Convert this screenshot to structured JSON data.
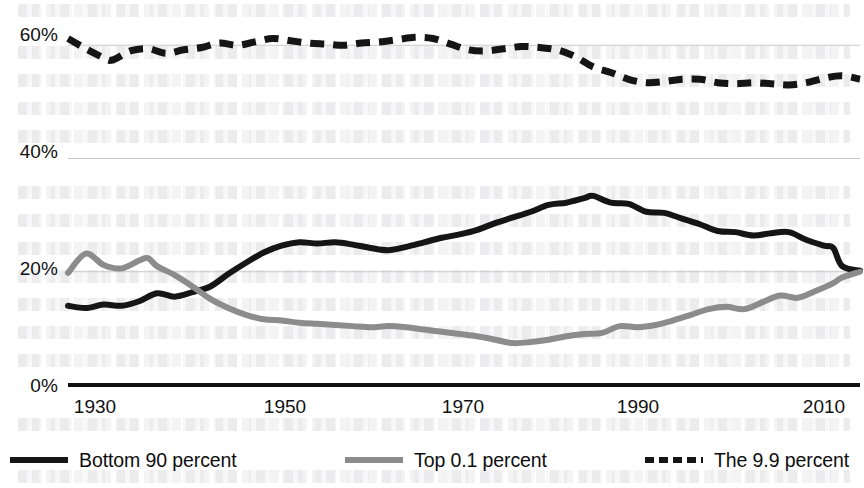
{
  "chart_data": {
    "type": "line",
    "title": "",
    "subtitle": "",
    "xlabel": "",
    "ylabel": "",
    "xlim": [
      1927,
      2016
    ],
    "ylim": [
      0,
      68
    ],
    "grid": true,
    "legend_position": "bottom",
    "y_ticks": [
      "0%",
      "20%",
      "40%",
      "60%"
    ],
    "y_tick_values": [
      0,
      20,
      40,
      60
    ],
    "x_ticks": [
      "1930",
      "1950",
      "1970",
      "1990",
      "2010"
    ],
    "x_tick_values": [
      1930,
      1950,
      1970,
      1990,
      2010
    ],
    "colors": {
      "bottom90": "#151515",
      "top01": "#8c8c8c",
      "the99": "#151515",
      "gridline": "#c9c9c9",
      "axis": "#111111",
      "background": "#ffffff"
    },
    "series": [
      {
        "name": "Bottom 90 percent",
        "style": "solid",
        "color": "#151515",
        "x": [
          1927,
          1929,
          1931,
          1933,
          1935,
          1937,
          1939,
          1941,
          1943,
          1945,
          1947,
          1949,
          1951,
          1953,
          1955,
          1957,
          1959,
          1961,
          1963,
          1965,
          1967,
          1969,
          1971,
          1973,
          1975,
          1977,
          1979,
          1981,
          1983,
          1985,
          1986,
          1988,
          1990,
          1992,
          1994,
          1996,
          1998,
          2000,
          2002,
          2004,
          2006,
          2008,
          2010,
          2012,
          2013,
          2014,
          2016
        ],
        "values": [
          14.0,
          13.6,
          14.2,
          14.0,
          14.8,
          16.2,
          15.6,
          16.4,
          17.4,
          19.6,
          21.6,
          23.4,
          24.6,
          25.2,
          25.0,
          25.2,
          24.8,
          24.2,
          23.8,
          24.4,
          25.2,
          26.0,
          26.6,
          27.4,
          28.6,
          29.6,
          30.6,
          31.8,
          32.2,
          33.0,
          33.4,
          32.2,
          32.0,
          30.6,
          30.4,
          29.4,
          28.4,
          27.2,
          27.0,
          26.4,
          26.8,
          27.0,
          25.6,
          24.6,
          24.2,
          21.0,
          20.2
        ]
      },
      {
        "name": "Top 0.1 percent",
        "style": "solid",
        "color": "#8c8c8c",
        "x": [
          1927,
          1929,
          1931,
          1933,
          1935,
          1936,
          1937,
          1939,
          1941,
          1943,
          1945,
          1947,
          1949,
          1951,
          1953,
          1955,
          1957,
          1959,
          1961,
          1963,
          1965,
          1967,
          1969,
          1971,
          1973,
          1975,
          1977,
          1979,
          1981,
          1983,
          1985,
          1987,
          1989,
          1991,
          1993,
          1995,
          1997,
          1999,
          2001,
          2003,
          2005,
          2007,
          2009,
          2011,
          2013,
          2014,
          2016
        ],
        "values": [
          19.8,
          23.2,
          21.2,
          20.6,
          22.0,
          22.4,
          21.0,
          19.4,
          17.4,
          15.2,
          13.6,
          12.4,
          11.6,
          11.4,
          11.0,
          10.8,
          10.6,
          10.4,
          10.2,
          10.4,
          10.2,
          9.8,
          9.4,
          9.0,
          8.6,
          8.0,
          7.4,
          7.6,
          8.0,
          8.6,
          9.0,
          9.2,
          10.4,
          10.2,
          10.6,
          11.4,
          12.4,
          13.4,
          13.8,
          13.4,
          14.6,
          15.8,
          15.4,
          16.6,
          18.0,
          19.0,
          20.0
        ]
      },
      {
        "name": "The 9.9 percent",
        "style": "dashed",
        "color": "#151515",
        "x": [
          1927,
          1929,
          1931,
          1932,
          1934,
          1936,
          1938,
          1940,
          1942,
          1944,
          1946,
          1948,
          1950,
          1952,
          1954,
          1956,
          1958,
          1960,
          1962,
          1964,
          1966,
          1968,
          1970,
          1972,
          1974,
          1976,
          1978,
          1980,
          1982,
          1984,
          1986,
          1988,
          1990,
          1992,
          1994,
          1996,
          1998,
          2000,
          2002,
          2004,
          2006,
          2008,
          2010,
          2012,
          2014,
          2016
        ],
        "values": [
          61.2,
          59.4,
          57.8,
          57.4,
          59.0,
          59.4,
          58.6,
          59.2,
          59.6,
          60.4,
          60.0,
          60.6,
          61.2,
          60.8,
          60.4,
          60.2,
          60.0,
          60.4,
          60.6,
          61.0,
          61.4,
          61.2,
          60.2,
          59.2,
          59.0,
          59.4,
          59.8,
          59.6,
          59.2,
          58.0,
          56.2,
          55.2,
          54.0,
          53.4,
          53.6,
          54.0,
          54.0,
          53.4,
          53.2,
          53.4,
          53.2,
          53.0,
          53.4,
          54.2,
          54.6,
          54.0
        ]
      }
    ]
  },
  "legend": {
    "items": [
      {
        "label": "Bottom 90 percent",
        "marker": "line-solid-dark-swatch"
      },
      {
        "label": "Top 0.1 percent",
        "marker": "line-solid-gray-swatch"
      },
      {
        "label": "The 9.9 percent",
        "marker": "line-dashed-dark-swatch"
      }
    ]
  },
  "axes": {
    "y_labels": [
      "60%",
      "40%",
      "20%",
      "0%"
    ],
    "x_labels": [
      "1930",
      "1950",
      "1970",
      "1990",
      "2010"
    ]
  }
}
